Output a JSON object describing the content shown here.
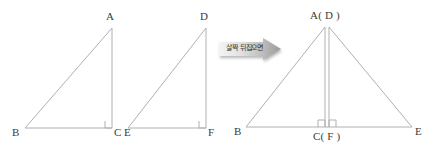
{
  "figure": {
    "background_color": "#ffffff",
    "stroke_color": "#b0b0b0",
    "label_color": "#3b3b3b",
    "left_triangle": {
      "name": "triangle-abc",
      "vertices": {
        "A": {
          "label": "A",
          "x": 112,
          "y": 28
        },
        "B": {
          "label": "B",
          "x": 25,
          "y": 128
        },
        "C": {
          "label": "C",
          "x": 112,
          "y": 128
        }
      },
      "right_angle_at": "C"
    },
    "middle_triangle": {
      "name": "triangle-def",
      "vertices": {
        "D": {
          "label": "D",
          "x": 206,
          "y": 28
        },
        "E": {
          "label": "E",
          "x": 128,
          "y": 128
        },
        "F": {
          "label": "F",
          "x": 206,
          "y": 128
        }
      },
      "right_angle_at": "F"
    },
    "right_figure": {
      "name": "triangle-combined",
      "apex_label": "A( D )",
      "base_left_label": "B",
      "base_center_label": "C( F )",
      "base_right_label": "E",
      "apex": {
        "x": 327,
        "y": 27
      },
      "base_left": {
        "x": 246,
        "y": 127
      },
      "base_right": {
        "x": 412,
        "y": 127
      },
      "base_center": {
        "x": 327,
        "y": 127
      },
      "right_angles": 2
    },
    "arrow": {
      "text": "살짝 뒤집으면",
      "direction": "right",
      "fill_start": "#f2f2f2",
      "fill_end": "#9d9d9d"
    }
  }
}
